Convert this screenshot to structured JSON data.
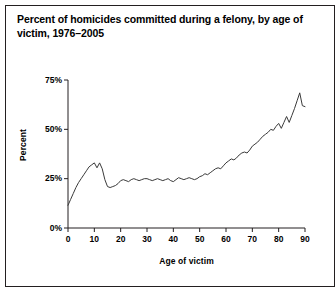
{
  "figure": {
    "title": "Percent of homicides committed during a felony, by age of victim, 1976–2005",
    "border_color": "#231f20",
    "background": "#ffffff"
  },
  "chart_data": {
    "type": "line",
    "title": "Percent of homicides committed during a felony, by age of victim, 1976–2005",
    "xlabel": "Age of victim",
    "ylabel": "Percent",
    "xlim": [
      0,
      90
    ],
    "ylim": [
      0,
      75
    ],
    "xticks": [
      0,
      10,
      20,
      30,
      40,
      50,
      60,
      70,
      80,
      90
    ],
    "xtick_labels": [
      "0",
      "10",
      "20",
      "30",
      "40",
      "50",
      "60",
      "70",
      "80",
      "90"
    ],
    "yticks": [
      0,
      25,
      50,
      75
    ],
    "ytick_labels": [
      "0%",
      "25%",
      "50%",
      "75%"
    ],
    "grid": false,
    "legend": false,
    "line_color": "#3a3a3a",
    "line_width": 1,
    "series": [
      {
        "name": "Percent of homicides committed during a felony",
        "x": [
          0,
          1,
          2,
          3,
          4,
          5,
          6,
          7,
          8,
          9,
          10,
          11,
          12,
          13,
          14,
          15,
          16,
          17,
          18,
          19,
          20,
          21,
          22,
          23,
          24,
          25,
          26,
          27,
          28,
          29,
          30,
          31,
          32,
          33,
          34,
          35,
          36,
          37,
          38,
          39,
          40,
          41,
          42,
          43,
          44,
          45,
          46,
          47,
          48,
          49,
          50,
          51,
          52,
          53,
          54,
          55,
          56,
          57,
          58,
          59,
          60,
          61,
          62,
          63,
          64,
          65,
          66,
          67,
          68,
          69,
          70,
          71,
          72,
          73,
          74,
          75,
          76,
          77,
          78,
          79,
          80,
          81,
          82,
          83,
          84,
          85,
          86,
          87,
          88,
          89,
          90
        ],
        "values": [
          11.5,
          14.5,
          17.5,
          20.5,
          23.0,
          25.0,
          27.0,
          29.0,
          31.0,
          32.0,
          33.0,
          30.5,
          33.0,
          30.0,
          24.5,
          21.0,
          20.5,
          21.0,
          21.5,
          22.5,
          24.0,
          24.5,
          24.0,
          23.5,
          24.5,
          25.0,
          24.5,
          24.0,
          24.5,
          25.0,
          25.0,
          24.5,
          24.0,
          24.5,
          25.0,
          24.5,
          24.0,
          24.5,
          25.0,
          24.0,
          23.5,
          24.5,
          25.5,
          25.0,
          24.5,
          25.0,
          25.5,
          25.0,
          24.5,
          25.0,
          26.0,
          26.5,
          27.5,
          27.0,
          28.0,
          29.0,
          30.0,
          30.5,
          30.0,
          31.5,
          33.0,
          34.0,
          35.0,
          34.5,
          35.5,
          37.0,
          38.0,
          38.5,
          38.0,
          39.5,
          41.5,
          42.5,
          43.5,
          45.0,
          46.5,
          47.5,
          48.5,
          50.0,
          49.5,
          51.5,
          53.0,
          50.5,
          53.5,
          56.5,
          53.5,
          57.0,
          60.5,
          64.5,
          68.5,
          62.0,
          61.5
        ]
      }
    ]
  }
}
